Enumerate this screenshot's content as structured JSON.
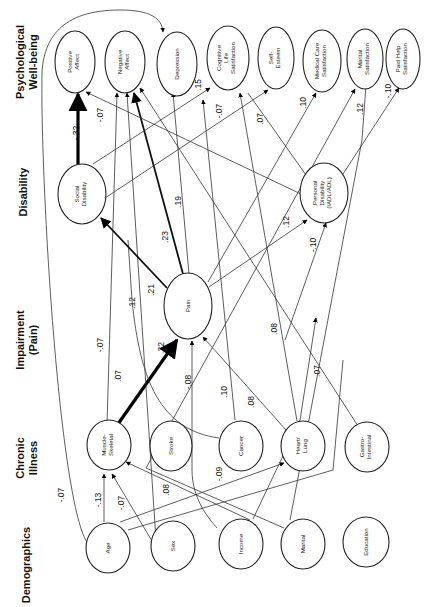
{
  "layers": [
    {
      "id": "demographics",
      "label": "Demographics"
    },
    {
      "id": "chronic",
      "label_line1": "Chronic",
      "label_line2": "Illness"
    },
    {
      "id": "impairment",
      "label_line1": "Impairment",
      "label_line2": "(Pain)"
    },
    {
      "id": "disability",
      "label": "Disability"
    },
    {
      "id": "wellbeing",
      "label_line1": "Psychological",
      "label_line2": "Well-being"
    }
  ],
  "nodes": {
    "age": {
      "label": "Age"
    },
    "sex": {
      "label": "Sex"
    },
    "income": {
      "label": "Income"
    },
    "marital": {
      "label": "Marital"
    },
    "education": {
      "label": "Education"
    },
    "musculo": {
      "l1": "Muscle-",
      "l2": "Skeletal"
    },
    "stroke": {
      "label": "Stroke"
    },
    "cancer": {
      "label": "Cancer"
    },
    "heart": {
      "l1": "Heart/",
      "l2": "Lung"
    },
    "gastro": {
      "l1": "Gastro-",
      "l2": "Intestinal"
    },
    "pain": {
      "label": "Pain"
    },
    "social": {
      "l1": "Social",
      "l2": "Disability"
    },
    "personal": {
      "l1": "Personal",
      "l2": "Disability",
      "l3": "(IADL/ADL)"
    },
    "posaff": {
      "l1": "Positive",
      "l2": "Affect"
    },
    "negaff": {
      "l1": "Negative",
      "l2": "Affect"
    },
    "depression": {
      "label": "Depression"
    },
    "cogsat": {
      "l1": "Cognitive",
      "l2": "Life",
      "l3": "Satisfaction"
    },
    "esteem": {
      "l1": "Self-",
      "l2": "Esteem"
    },
    "medsat": {
      "l1": "Medical Care",
      "l2": "Satisfaction"
    },
    "marsat": {
      "l1": "Marital",
      "l2": "Satisfaction"
    },
    "paidsat": {
      "l1": "Paid Help",
      "l2": "Satisfaction"
    }
  },
  "edges": [
    {
      "from": "age",
      "to": "musculo",
      "coef": "-.13"
    },
    {
      "from": "sex",
      "to": "musculo",
      "coef": "-.07"
    },
    {
      "from": "income",
      "to": "musculo",
      "coef": ".08"
    },
    {
      "from": "age",
      "to": "depression",
      "coef": "-.07"
    },
    {
      "from": "age",
      "to": "heart",
      "coef": ".08"
    },
    {
      "from": "income",
      "to": "heart",
      "coef": "-.09"
    },
    {
      "from": "musculo",
      "to": "pain",
      "coef": ".32"
    },
    {
      "from": "musculo",
      "to": "negaff",
      "coef": "-.07"
    },
    {
      "from": "sex",
      "to": "negaff",
      "coef": ".07"
    },
    {
      "from": "income",
      "to": "pain",
      "coef": "-.08"
    },
    {
      "from": "cancer",
      "to": "pain",
      "coef": ".10"
    },
    {
      "from": "heart",
      "to": "pain",
      "coef": ".08"
    },
    {
      "from": "heart",
      "to": "cogsat",
      "coef": ".08"
    },
    {
      "from": "gastro",
      "to": "negaff",
      "coef": ".07"
    },
    {
      "from": "cancer",
      "to": "negaff",
      "coef": ".12"
    },
    {
      "from": "pain",
      "to": "social",
      "coef": ".21"
    },
    {
      "from": "pain",
      "to": "negaff",
      "coef": ".23"
    },
    {
      "from": "pain",
      "to": "depression",
      "coef": ".19"
    },
    {
      "from": "pain",
      "to": "personal",
      "coef": ".12"
    },
    {
      "from": "income",
      "to": "personal",
      "coef": "-.10"
    },
    {
      "from": "social",
      "to": "posaff",
      "coef": "-.32"
    },
    {
      "from": "personal",
      "to": "posaff",
      "coef": "-.07"
    },
    {
      "from": "social",
      "to": "depression",
      "coef": ".15"
    },
    {
      "from": "social",
      "to": "esteem",
      "coef": "-.07"
    },
    {
      "from": "personal",
      "to": "cogsat",
      "coef": ".07"
    },
    {
      "from": "pain",
      "to": "medsat",
      "coef": ".10"
    },
    {
      "from": "marital",
      "to": "marsat",
      "coef": ".12"
    },
    {
      "from": "personal",
      "to": "paidsat",
      "coef": "-.10"
    }
  ]
}
